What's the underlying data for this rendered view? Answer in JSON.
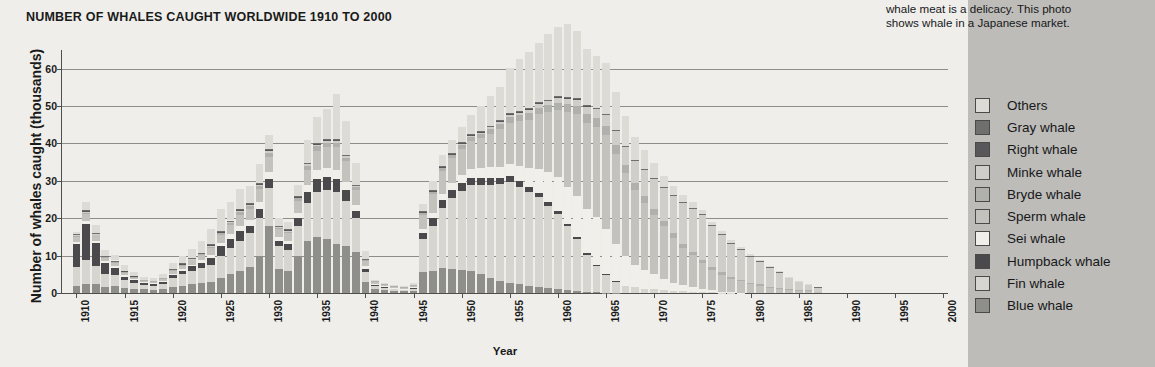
{
  "caption": {
    "lines": [
      "whale meat is a delicacy. This photo",
      "shows whale in a Japanese market."
    ]
  },
  "chart_data": {
    "type": "bar",
    "subtype": "stacked-bar",
    "title": "NUMBER OF WHALES CAUGHT WORLDWIDE 1910 TO 2000",
    "xlabel": "Year",
    "ylabel": "Number of whales caught (thousands)",
    "ylim": [
      0,
      65
    ],
    "yticks": [
      0,
      10,
      20,
      30,
      40,
      50,
      60
    ],
    "xticks": [
      1910,
      1915,
      1920,
      1925,
      1930,
      1935,
      1940,
      1945,
      1950,
      1955,
      1960,
      1965,
      1970,
      1975,
      1980,
      1985,
      1990,
      1995,
      2000
    ],
    "xlim": [
      1909,
      2001
    ],
    "grid": true,
    "legend_position": "right",
    "colors": {
      "Others": "#dcdbd6",
      "Gray whale": "#6f6f6d",
      "Right whale": "#58585a",
      "Minke whale": "#cfcec9",
      "Bryde whale": "#b0b0ac",
      "Sperm whale": "#c3c2bd",
      "Sei whale": "#f0efe9",
      "Humpback whale": "#4a4a4c",
      "Fin whale": "#d6d5d0",
      "Blue whale": "#8e8e8b"
    },
    "legend": [
      "Others",
      "Gray whale",
      "Right whale",
      "Minke whale",
      "Bryde whale",
      "Sperm whale",
      "Sei whale",
      "Humpback whale",
      "Fin whale",
      "Blue whale"
    ],
    "x": [
      1910,
      1911,
      1912,
      1913,
      1914,
      1915,
      1916,
      1917,
      1918,
      1919,
      1920,
      1921,
      1922,
      1923,
      1924,
      1925,
      1926,
      1927,
      1928,
      1929,
      1930,
      1931,
      1932,
      1933,
      1934,
      1935,
      1936,
      1937,
      1938,
      1939,
      1940,
      1941,
      1942,
      1943,
      1944,
      1945,
      1946,
      1947,
      1948,
      1949,
      1950,
      1951,
      1952,
      1953,
      1954,
      1955,
      1956,
      1957,
      1958,
      1959,
      1960,
      1961,
      1962,
      1963,
      1964,
      1965,
      1966,
      1967,
      1968,
      1969,
      1970,
      1971,
      1972,
      1973,
      1974,
      1975,
      1976,
      1977,
      1978,
      1979,
      1980,
      1981,
      1982,
      1983,
      1984,
      1985,
      1986,
      1987
    ],
    "series": [
      {
        "name": "Blue whale",
        "values": [
          2.0,
          2.4,
          2.3,
          1.6,
          1.8,
          1.4,
          1.2,
          1.0,
          0.9,
          1.0,
          1.6,
          2.0,
          2.4,
          2.6,
          3.0,
          4.0,
          5.0,
          6.0,
          7.0,
          10.0,
          18.0,
          6.5,
          6.0,
          10.0,
          14.0,
          15.0,
          14.5,
          13.0,
          12.5,
          11.0,
          3.0,
          1.0,
          0.8,
          0.6,
          0.5,
          0.5,
          5.5,
          6.0,
          6.8,
          6.5,
          6.2,
          5.8,
          5.0,
          4.0,
          3.2,
          2.8,
          2.4,
          2.0,
          1.6,
          1.3,
          1.1,
          0.8,
          0.5,
          0.3,
          0.2,
          0.1,
          0.05,
          0.0,
          0.0,
          0.0,
          0.0,
          0.0,
          0.0,
          0.0,
          0.0,
          0.0,
          0.0,
          0.0,
          0.0,
          0.0,
          0.0,
          0.0,
          0.0,
          0.0,
          0.0,
          0.0,
          0.0,
          0.0
        ]
      },
      {
        "name": "Fin whale",
        "values": [
          5.0,
          6.5,
          5.0,
          3.5,
          3.0,
          2.0,
          1.5,
          1.2,
          1.0,
          1.5,
          2.5,
          3.0,
          3.5,
          4.0,
          4.5,
          6.0,
          7.0,
          8.0,
          9.0,
          10.0,
          10.0,
          6.0,
          5.5,
          8.0,
          10.0,
          12.0,
          13.0,
          14.0,
          12.0,
          9.0,
          2.5,
          0.8,
          0.6,
          0.5,
          0.4,
          0.5,
          9.0,
          12.0,
          16.0,
          19.0,
          21.0,
          23.0,
          24.0,
          25.0,
          26.0,
          27.0,
          26.0,
          25.0,
          24.0,
          22.0,
          20.0,
          17.0,
          14.0,
          10.0,
          7.0,
          5.0,
          3.0,
          2.0,
          1.5,
          1.2,
          1.0,
          0.8,
          0.6,
          0.5,
          0.4,
          0.3,
          0.2,
          0.1,
          0.1,
          0.0,
          0.0,
          0.0,
          0.0,
          0.0,
          0.0,
          0.0,
          0.0,
          0.0
        ]
      },
      {
        "name": "Humpback whale",
        "values": [
          6.0,
          9.5,
          6.0,
          3.0,
          2.0,
          1.0,
          0.8,
          0.6,
          0.5,
          0.6,
          0.8,
          1.0,
          1.2,
          1.5,
          2.0,
          2.5,
          2.5,
          2.5,
          2.0,
          2.5,
          2.5,
          1.5,
          1.5,
          2.0,
          3.0,
          3.5,
          3.5,
          3.5,
          3.0,
          2.0,
          1.0,
          0.4,
          0.3,
          0.2,
          0.2,
          0.3,
          1.5,
          2.0,
          2.0,
          2.0,
          2.2,
          2.0,
          1.8,
          1.8,
          1.6,
          1.5,
          1.5,
          1.4,
          1.2,
          1.0,
          0.8,
          0.6,
          0.4,
          0.3,
          0.2,
          0.1,
          0.05,
          0.0,
          0.0,
          0.0,
          0.0,
          0.0,
          0.0,
          0.0,
          0.0,
          0.0,
          0.0,
          0.0,
          0.0,
          0.0,
          0.0,
          0.0,
          0.0,
          0.0,
          0.0,
          0.0,
          0.0,
          0.0
        ]
      },
      {
        "name": "Sei whale",
        "values": [
          0.6,
          0.8,
          0.6,
          0.4,
          0.4,
          0.3,
          0.2,
          0.2,
          0.2,
          0.2,
          0.3,
          0.4,
          0.5,
          0.6,
          0.8,
          1.0,
          1.2,
          1.5,
          1.5,
          1.8,
          2.0,
          1.0,
          1.0,
          1.5,
          2.0,
          2.5,
          2.5,
          2.5,
          2.2,
          1.5,
          0.6,
          0.2,
          0.2,
          0.1,
          0.1,
          0.2,
          1.0,
          1.5,
          1.8,
          2.0,
          2.2,
          2.4,
          2.6,
          2.8,
          3.0,
          3.2,
          4.0,
          5.0,
          6.5,
          8.0,
          9.0,
          10.0,
          11.0,
          12.0,
          13.0,
          12.0,
          10.0,
          8.0,
          6.0,
          5.0,
          4.0,
          3.0,
          2.2,
          1.6,
          1.2,
          0.8,
          0.5,
          0.3,
          0.2,
          0.1,
          0.0,
          0.0,
          0.0,
          0.0,
          0.0,
          0.0,
          0.0,
          0.0
        ]
      },
      {
        "name": "Sperm whale",
        "values": [
          1.5,
          2.0,
          1.5,
          1.0,
          1.0,
          0.8,
          0.6,
          0.5,
          0.5,
          0.6,
          0.8,
          1.0,
          1.2,
          1.5,
          1.8,
          2.0,
          2.5,
          3.0,
          3.0,
          3.5,
          4.0,
          2.0,
          2.0,
          3.0,
          4.0,
          5.0,
          5.5,
          6.0,
          5.5,
          4.0,
          1.5,
          0.6,
          0.4,
          0.3,
          0.3,
          0.5,
          4.0,
          5.0,
          6.0,
          6.5,
          7.0,
          7.5,
          8.0,
          9.0,
          10.0,
          11.0,
          12.0,
          13.0,
          14.5,
          16.0,
          18.0,
          20.0,
          22.0,
          23.0,
          24.0,
          25.0,
          24.0,
          22.0,
          20.0,
          18.0,
          16.0,
          14.0,
          12.0,
          10.0,
          8.5,
          7.0,
          5.5,
          4.5,
          3.5,
          3.0,
          2.5,
          2.0,
          1.5,
          1.2,
          1.0,
          0.8,
          0.6,
          0.4
        ]
      },
      {
        "name": "Bryde whale",
        "values": [
          0.3,
          0.4,
          0.3,
          0.2,
          0.2,
          0.2,
          0.1,
          0.1,
          0.1,
          0.1,
          0.2,
          0.2,
          0.3,
          0.3,
          0.4,
          0.5,
          0.6,
          0.7,
          0.8,
          0.9,
          1.0,
          0.5,
          0.5,
          0.8,
          1.0,
          1.2,
          1.2,
          1.2,
          1.0,
          0.8,
          0.3,
          0.1,
          0.1,
          0.1,
          0.1,
          0.1,
          0.5,
          0.6,
          0.8,
          0.9,
          1.0,
          1.1,
          1.2,
          1.3,
          1.4,
          1.5,
          1.6,
          1.7,
          1.8,
          1.9,
          2.0,
          2.1,
          2.2,
          2.3,
          2.4,
          2.5,
          2.4,
          2.2,
          2.0,
          1.8,
          1.6,
          1.4,
          1.2,
          1.0,
          0.9,
          0.8,
          0.7,
          0.6,
          0.5,
          0.4,
          0.3,
          0.3,
          0.2,
          0.2,
          0.1,
          0.1,
          0.1,
          0.0
        ]
      },
      {
        "name": "Minke whale",
        "values": [
          0.1,
          0.1,
          0.1,
          0.1,
          0.1,
          0.1,
          0.1,
          0.0,
          0.0,
          0.0,
          0.1,
          0.1,
          0.1,
          0.1,
          0.2,
          0.2,
          0.2,
          0.3,
          0.3,
          0.3,
          0.4,
          0.2,
          0.2,
          0.3,
          0.4,
          0.4,
          0.5,
          0.5,
          0.4,
          0.3,
          0.1,
          0.0,
          0.0,
          0.0,
          0.0,
          0.0,
          0.2,
          0.2,
          0.3,
          0.3,
          0.4,
          0.4,
          0.5,
          0.6,
          0.7,
          0.8,
          0.9,
          1.0,
          1.1,
          1.2,
          1.4,
          1.6,
          1.8,
          2.0,
          2.5,
          3.0,
          4.0,
          5.0,
          6.0,
          7.0,
          8.0,
          9.0,
          10.0,
          11.0,
          11.5,
          12.0,
          11.0,
          10.0,
          9.0,
          8.0,
          7.0,
          6.0,
          5.0,
          4.0,
          3.0,
          2.0,
          1.5,
          1.0
        ]
      },
      {
        "name": "Right whale",
        "values": [
          0.2,
          0.3,
          0.2,
          0.1,
          0.1,
          0.1,
          0.1,
          0.0,
          0.0,
          0.0,
          0.1,
          0.1,
          0.1,
          0.1,
          0.2,
          0.2,
          0.2,
          0.2,
          0.2,
          0.3,
          0.3,
          0.2,
          0.2,
          0.2,
          0.3,
          0.3,
          0.3,
          0.3,
          0.2,
          0.2,
          0.1,
          0.0,
          0.0,
          0.0,
          0.0,
          0.0,
          0.1,
          0.1,
          0.1,
          0.1,
          0.1,
          0.1,
          0.1,
          0.1,
          0.1,
          0.1,
          0.1,
          0.1,
          0.1,
          0.1,
          0.1,
          0.1,
          0.1,
          0.1,
          0.0,
          0.0,
          0.0,
          0.0,
          0.0,
          0.0,
          0.0,
          0.0,
          0.0,
          0.0,
          0.0,
          0.0,
          0.0,
          0.0,
          0.0,
          0.0,
          0.0,
          0.0,
          0.0,
          0.0,
          0.0,
          0.0,
          0.0,
          0.0
        ]
      },
      {
        "name": "Gray whale",
        "values": [
          0.1,
          0.1,
          0.1,
          0.1,
          0.1,
          0.0,
          0.0,
          0.0,
          0.0,
          0.0,
          0.1,
          0.1,
          0.1,
          0.1,
          0.1,
          0.1,
          0.2,
          0.2,
          0.2,
          0.2,
          0.2,
          0.1,
          0.1,
          0.2,
          0.2,
          0.2,
          0.2,
          0.2,
          0.2,
          0.1,
          0.1,
          0.0,
          0.0,
          0.0,
          0.0,
          0.0,
          0.1,
          0.1,
          0.2,
          0.2,
          0.2,
          0.2,
          0.2,
          0.2,
          0.2,
          0.2,
          0.2,
          0.2,
          0.2,
          0.2,
          0.2,
          0.2,
          0.2,
          0.2,
          0.2,
          0.2,
          0.2,
          0.2,
          0.2,
          0.2,
          0.2,
          0.2,
          0.2,
          0.2,
          0.2,
          0.2,
          0.2,
          0.2,
          0.2,
          0.2,
          0.2,
          0.2,
          0.2,
          0.2,
          0.2,
          0.2,
          0.1,
          0.1
        ]
      },
      {
        "name": "Others",
        "values": [
          0.5,
          2.3,
          2.0,
          1.5,
          1.5,
          1.5,
          1.0,
          0.8,
          0.8,
          1.0,
          1.5,
          2.0,
          2.5,
          3.0,
          4.0,
          6.0,
          5.0,
          5.5,
          4.5,
          5.0,
          4.0,
          2.0,
          2.0,
          3.0,
          6.0,
          7.0,
          8.0,
          12.0,
          9.0,
          6.0,
          2.0,
          0.5,
          0.4,
          0.3,
          0.3,
          0.5,
          2.0,
          2.5,
          3.0,
          3.5,
          4.0,
          5.0,
          6.5,
          8.0,
          9.0,
          12.0,
          14.0,
          15.0,
          16.0,
          17.5,
          18.5,
          19.5,
          18.0,
          15.0,
          14.0,
          13.5,
          10.0,
          8.0,
          6.0,
          5.0,
          4.0,
          3.0,
          2.5,
          2.0,
          1.6,
          1.2,
          1.0,
          0.8,
          0.6,
          0.5,
          0.4,
          0.3,
          0.2,
          0.2,
          0.1,
          0.1,
          0.1,
          0.0
        ]
      }
    ]
  }
}
